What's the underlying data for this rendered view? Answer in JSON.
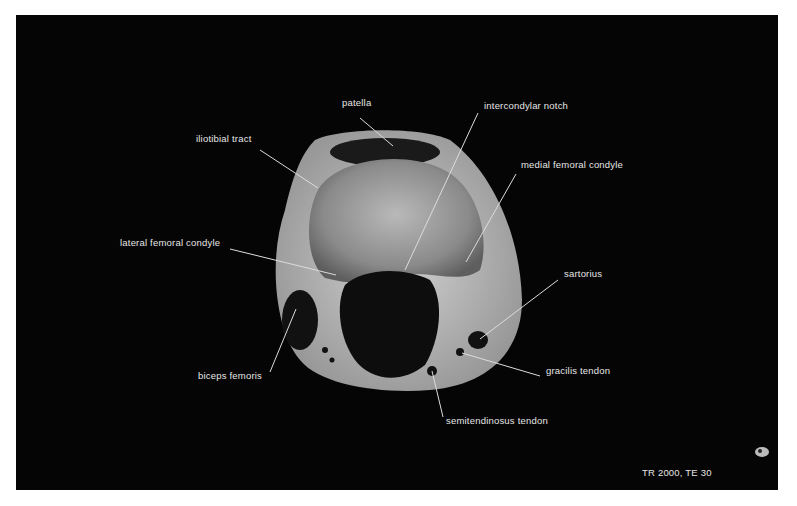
{
  "figure": {
    "labels": [
      {
        "id": "patella",
        "text": "patella",
        "x": 342,
        "y": 104,
        "lx1": 360,
        "ly1": 118,
        "lx2": 393,
        "ly2": 146
      },
      {
        "id": "intercondylar-notch",
        "text": "intercondylar notch",
        "x": 484,
        "y": 107,
        "lx1": 478,
        "ly1": 113,
        "lx2": 405,
        "ly2": 270
      },
      {
        "id": "iliotibial-tract",
        "text": "iliotibial tract",
        "x": 196,
        "y": 139,
        "lx1": 260,
        "ly1": 150,
        "lx2": 318,
        "ly2": 188
      },
      {
        "id": "medial-femoral-condyle",
        "text": "medial femoral condyle",
        "x": 521,
        "y": 165,
        "lx1": 516,
        "ly1": 174,
        "lx2": 466,
        "ly2": 262
      },
      {
        "id": "lateral-femoral-condyle",
        "text": "lateral femoral condyle",
        "x": 120,
        "y": 243,
        "lx1": 230,
        "ly1": 249,
        "lx2": 336,
        "ly2": 275
      },
      {
        "id": "sartorius",
        "text": "sartorius",
        "x": 564,
        "y": 274,
        "lx1": 558,
        "ly1": 280,
        "lx2": 480,
        "ly2": 339
      },
      {
        "id": "biceps-femoris",
        "text": "biceps femoris",
        "x": 198,
        "y": 376,
        "lx1": 270,
        "ly1": 372,
        "lx2": 296,
        "ly2": 309
      },
      {
        "id": "gracilis-tendon",
        "text": "gracilis tendon",
        "x": 546,
        "y": 371,
        "lx1": 540,
        "ly1": 376,
        "lx2": 462,
        "ly2": 353
      },
      {
        "id": "semitendinosus-tendon",
        "text": "semitendinosus tendon",
        "x": 446,
        "y": 421,
        "lx1": 443,
        "ly1": 417,
        "lx2": 432,
        "ly2": 371
      }
    ],
    "sequence_caption": "TR 2000, TE 30"
  }
}
